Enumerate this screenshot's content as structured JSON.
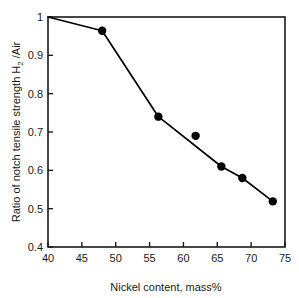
{
  "chart_data": {
    "type": "line",
    "title": "",
    "xlabel": "Nickel content, mass%",
    "ylabel": "Ratio of notch tensile strength H2 /Air",
    "ylabel_parts": {
      "pre": "Ratio of notch tensile strength H",
      "subscript": "2",
      "post": " /Air"
    },
    "xlim": [
      40,
      75
    ],
    "ylim": [
      0.4,
      1
    ],
    "xticks": [
      40,
      45,
      50,
      55,
      60,
      65,
      70,
      75
    ],
    "xtick_labels": [
      "40",
      "45",
      "50",
      "55",
      "60",
      "65",
      "70",
      "75"
    ],
    "yticks": [
      0.4,
      0.5,
      0.6,
      0.7,
      0.8,
      0.9,
      1
    ],
    "ytick_labels": [
      "0.4",
      "0.5",
      "0.6",
      "0.7",
      "0.8",
      "0.9",
      "1"
    ],
    "grid": false,
    "legend": null,
    "series": [
      {
        "name": "Notch tensile strength ratio",
        "marker": "filled-circle",
        "marker_color": "#000000",
        "line_color": "#000000",
        "x": [
          40,
          48,
          56.3,
          61.8,
          65.6,
          68.7,
          73.2
        ],
        "y": [
          1.0,
          0.964,
          0.74,
          0.69,
          0.61,
          0.58,
          0.519
        ],
        "point_markers": [
          false,
          true,
          true,
          true,
          true,
          true,
          true
        ],
        "line_path_x": [
          40,
          48,
          56.3,
          65.6,
          68.7,
          73.2
        ],
        "line_path_y": [
          1.0,
          0.964,
          0.74,
          0.61,
          0.58,
          0.519
        ]
      }
    ]
  },
  "figure": {
    "background_color": "#ffffff",
    "axis_color": "#1a1a1a",
    "marker_radius_px": 4.2
  }
}
